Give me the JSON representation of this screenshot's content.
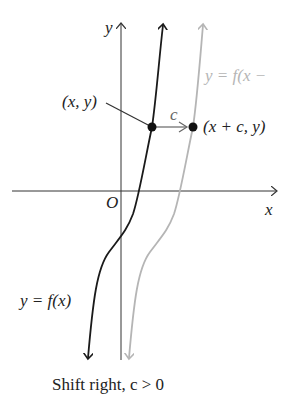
{
  "diagram": {
    "type": "function-graph-transformation",
    "axes": {
      "x_label": "x",
      "y_label": "y",
      "origin_label": "O"
    },
    "curves": [
      {
        "name": "original",
        "label": "y = f(x)",
        "color": "#1a1a1a"
      },
      {
        "name": "shifted",
        "label": "y = f(x −",
        "color": "#b5b5b5"
      }
    ],
    "points": [
      {
        "label": "(x, y)"
      },
      {
        "label": "(x + c,  y)"
      }
    ],
    "shift_label": "c",
    "caption": "Shift right, c > 0",
    "colors": {
      "original": "#1a1a1a",
      "shifted": "#b5b5b5",
      "axis": "#333333"
    }
  }
}
